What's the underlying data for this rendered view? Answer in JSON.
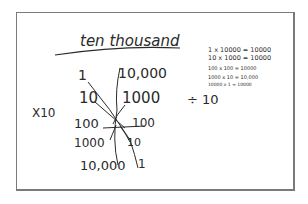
{
  "sketch": {
    "title": "ten thousand",
    "multiplier_label": "X10",
    "divider_label": "÷ 10",
    "left_column": [
      "1",
      "10",
      "100",
      "1000",
      "10,000"
    ],
    "right_column": [
      "10,000",
      "1000",
      "100",
      "10",
      "1"
    ],
    "equations": [
      "1 x 10000 = 10000",
      "10 x 1000 = 10000",
      "100 x 100 = 10000",
      "1000 x 10 = 10,000",
      "10000 x 1 = 10000"
    ]
  },
  "colors": {
    "ink": "#2b2b2b",
    "frame": "#7a7a7a",
    "background": "#ffffff"
  }
}
